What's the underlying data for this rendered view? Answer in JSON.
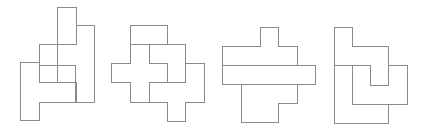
{
  "diagram": {
    "title": "",
    "line_color": "#8a8a8a",
    "background": "#ffffff",
    "figures": [
      {
        "id": "figure-1",
        "polygons": [
          "57,7 76,7 76,44 57,44 57,65 39,65 39,44 57,44",
          "76,25 94,25 94,102 76,102 76,82 75,82 75,65 57,65 57,44 76,44",
          "39,44 57,44 57,82 39,82",
          "57,65 75,65 75,82 57,82",
          "20,62 39,62 39,82 75,82 75,102 39,102 39,120 20,120"
        ]
      },
      {
        "id": "figure-2",
        "polygons": [
          "130,25 167,25 167,44 130,44",
          "149,44 167,44 167,25 167,44 185,44 185,82 167,82 167,63 149,63",
          "130,44 149,44 149,63 167,63 167,82 149,82 149,102 130,102 130,82 111,82 111,63 130,63",
          "149,82 185,82 185,63 204,63 204,102 185,102 185,121 167,121 167,102 149,102"
        ]
      },
      {
        "id": "figure-3",
        "polygons": [
          "260,27 278,27 278,46 297,46 297,65 222,65 222,46 260,46",
          "222,65 315,65 315,84 222,84",
          "241,84 297,84 297,103 278,103 278,122 241,122"
        ]
      },
      {
        "id": "figure-4",
        "polygons": [
          "334,27 352,27 352,46 388,46 388,85 370,85 370,65 334,65",
          "334,65 352,65 352,104 388,104 388,123 334,123",
          "352,65 370,65 370,85 388,85 388,65 407,65 407,104 352,104"
        ]
      }
    ]
  }
}
